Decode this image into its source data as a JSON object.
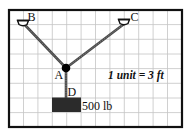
{
  "diagram": {
    "labels": {
      "B": "B",
      "C": "C",
      "A": "A",
      "D": "D"
    },
    "weight_label": "500 lb",
    "scale_label": "1 unit = 3 ft",
    "grid": {
      "columns": 12,
      "rows": 8
    },
    "points": {
      "B": {
        "grid_x": 1,
        "grid_y": 1
      },
      "C": {
        "grid_x": 8,
        "grid_y": 1
      },
      "A": {
        "grid_x": 4,
        "grid_y": 4
      },
      "D": {
        "grid_x": 4,
        "grid_y": 6
      }
    },
    "colors": {
      "frame": "#111111",
      "grid": "#c4c4c4",
      "cable": "#4a4a4a",
      "block": "#2b2b2b",
      "node": "#000000"
    }
  }
}
